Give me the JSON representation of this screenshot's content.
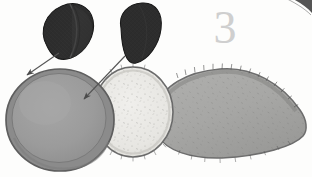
{
  "figure": {
    "number_label": "3",
    "caption": "",
    "background_color": "#fdfdfc"
  },
  "palette": {
    "dark_specimen": "#2c2c2c",
    "dark_specimen_highlight": "#4a4a4a",
    "dark_specimen_outline": "#151515",
    "disc_left_fill": "#9b9b9b",
    "disc_left_rim": "#888888",
    "disc_left_outline": "#5e5e5e",
    "disc_middle_fill": "#e9e8e4",
    "disc_middle_outline": "#6a6a6a",
    "body_fill": "#a7a7a5",
    "body_outline": "#6d6d6d",
    "arrow_color": "#555555",
    "figure_number_color": "#cfcfcf",
    "corner_mark_color": "#3a3a3a"
  },
  "elements": {
    "dark_shape_left": {
      "name": "dark teardrop structure (left)",
      "center_x": 68,
      "center_y": 32,
      "width": 52,
      "height": 58,
      "has_median_ridge": true
    },
    "dark_shape_right": {
      "name": "dark teardrop structure (right)",
      "center_x": 138,
      "center_y": 33,
      "width": 44,
      "height": 60,
      "has_median_ridge": false
    },
    "disc_left": {
      "name": "large gray disc",
      "center_x": 60,
      "center_y": 120,
      "radius_x": 53,
      "radius_y": 50,
      "rim_width": 6
    },
    "disc_middle": {
      "name": "pale speckled disc",
      "center_x": 133,
      "center_y": 112,
      "radius_x": 40,
      "radius_y": 44
    },
    "body_right": {
      "name": "elongated setose body",
      "left_x": 155,
      "right_tip_x": 306,
      "top_y": 70,
      "bottom_y": 158
    },
    "arrow_one": {
      "name": "arrow to disc rim",
      "from_x": 58,
      "from_y": 52,
      "to_x": 25,
      "to_y": 76
    },
    "arrow_two": {
      "name": "arrow to disc interior",
      "from_x": 124,
      "from_y": 56,
      "to_x": 82,
      "to_y": 100
    },
    "corner_mark": {
      "name": "partial structure at top-right corner",
      "x": 285,
      "y": 0
    }
  }
}
